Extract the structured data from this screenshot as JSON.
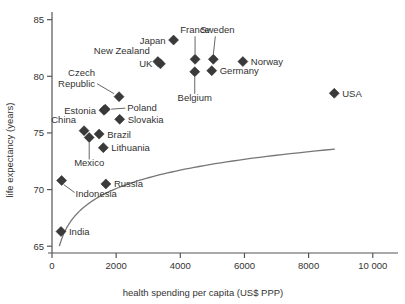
{
  "chart_data": {
    "type": "scatter",
    "title": "",
    "xlabel": "health spending per capita (US$ PPP)",
    "ylabel": "life expectancy (years)",
    "xlim": [
      0,
      10600
    ],
    "ylim": [
      64.4,
      85.5
    ],
    "xticks": [
      0,
      2000,
      4000,
      6000,
      8000,
      10000
    ],
    "xticklabels": [
      "0",
      "2000",
      "4000",
      "6000",
      "8000",
      "10 000"
    ],
    "yticks": [
      65,
      70,
      75,
      80,
      85
    ],
    "yticklabels": [
      "65",
      "70",
      "75",
      "80",
      "85"
    ],
    "grid": false,
    "legend": false,
    "marker_shape": "diamond",
    "marker_color": "#3a3a3a",
    "trendline": {
      "present": true,
      "color": "#777777",
      "description": "logarithmic fit curve rising steeply at low spending then flattening near 84 years"
    },
    "points": [
      {
        "label": "India",
        "x": 280,
        "y": 66.3,
        "label_pos": "right"
      },
      {
        "label": "Indonesia",
        "x": 300,
        "y": 70.8,
        "label_pos": "leader-down-right"
      },
      {
        "label": "China",
        "x": 1000,
        "y": 75.2,
        "label_pos": "above-left"
      },
      {
        "label": "Mexico",
        "x": 1160,
        "y": 74.6,
        "label_pos": "leader-down"
      },
      {
        "label": "Brazil",
        "x": 1470,
        "y": 74.9,
        "label_pos": "right"
      },
      {
        "label": "Russia",
        "x": 1680,
        "y": 70.5,
        "label_pos": "right"
      },
      {
        "label": "Lithuania",
        "x": 1600,
        "y": 73.7,
        "label_pos": "right"
      },
      {
        "label": "Estonia",
        "x": 1620,
        "y": 77.0,
        "label_pos": "left"
      },
      {
        "label": "Poland",
        "x": 1660,
        "y": 77.1,
        "label_pos": "leader-right"
      },
      {
        "label": "Czech Republic",
        "x": 2090,
        "y": 78.2,
        "label_pos": "leader-up-left"
      },
      {
        "label": "Slovakia",
        "x": 2110,
        "y": 76.2,
        "label_pos": "right"
      },
      {
        "label": "UK",
        "x": 3380,
        "y": 81.1,
        "label_pos": "left"
      },
      {
        "label": "New Zealand",
        "x": 3300,
        "y": 81.3,
        "label_pos": "above-left"
      },
      {
        "label": "Japan",
        "x": 3790,
        "y": 83.2,
        "label_pos": "left"
      },
      {
        "label": "Belgium",
        "x": 4450,
        "y": 80.4,
        "label_pos": "leader-down"
      },
      {
        "label": "France",
        "x": 4460,
        "y": 81.5,
        "label_pos": "leader-up"
      },
      {
        "label": "Sweden",
        "x": 5030,
        "y": 81.5,
        "label_pos": "leader-up-right"
      },
      {
        "label": "Germany",
        "x": 4980,
        "y": 80.5,
        "label_pos": "right"
      },
      {
        "label": "Norway",
        "x": 5950,
        "y": 81.3,
        "label_pos": "right"
      },
      {
        "label": "USA",
        "x": 8800,
        "y": 78.5,
        "label_pos": "right"
      }
    ]
  }
}
